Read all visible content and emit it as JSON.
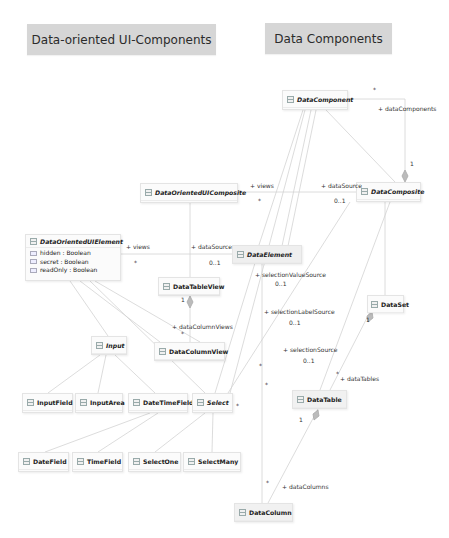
{
  "headers": {
    "ui_components": "Data-oriented UI-Components",
    "data_components": "Data Components"
  },
  "classes": {
    "DataComponent": {
      "name": "DataComponent",
      "abstract": true
    },
    "DataOrientedUIComposite": {
      "name": "DataOrientedUIComposite",
      "abstract": true
    },
    "DataComposite": {
      "name": "DataComposite",
      "abstract": true
    },
    "DataOrientedUIElement": {
      "name": "DataOrientedUIElement",
      "abstract": true,
      "attributes": [
        "hidden : Boolean",
        "secret : Boolean",
        "readOnly : Boolean"
      ]
    },
    "DataElement": {
      "name": "DataElement",
      "abstract": true
    },
    "DataTableView": {
      "name": "DataTableView",
      "abstract": false
    },
    "DataSet": {
      "name": "DataSet",
      "abstract": false
    },
    "Input": {
      "name": "Input",
      "abstract": true
    },
    "DataColumnView": {
      "name": "DataColumnView",
      "abstract": false
    },
    "InputField": {
      "name": "InputField",
      "abstract": false
    },
    "InputArea": {
      "name": "InputArea",
      "abstract": false
    },
    "DateTimeField": {
      "name": "DateTimeField",
      "abstract": false
    },
    "Select": {
      "name": "Select",
      "abstract": true
    },
    "DataTable": {
      "name": "DataTable",
      "abstract": false
    },
    "DateField": {
      "name": "DateField",
      "abstract": false
    },
    "TimeField": {
      "name": "TimeField",
      "abstract": false
    },
    "SelectOne": {
      "name": "SelectOne",
      "abstract": false
    },
    "SelectMany": {
      "name": "SelectMany",
      "abstract": false
    },
    "DataColumn": {
      "name": "DataColumn",
      "abstract": false
    }
  },
  "labels": {
    "dataComponents_mult": "*",
    "dataComponents_role": "+ dataComponents",
    "dataComponents_one": "1",
    "composite_views_role": "+ views",
    "composite_views_mult": "*",
    "composite_dataSource_role": "+ dataSource",
    "composite_dataSource_mult": "0..1",
    "element_views_role": "+ views",
    "element_views_mult": "*",
    "element_dataSource_role": "+ dataSource",
    "element_dataSource_mult": "0..1",
    "selectionValueSource_role": "+ selectionValueSource",
    "selectionValueSource_mult": "0..1",
    "selectionLabelSource_role": "+ selectionLabelSource",
    "selectionLabelSource_mult": "0..1",
    "selectionSource_role": "+ selectionSource",
    "selectionSource_mult": "0..1",
    "tableview_one": "1",
    "dataColumnViews_role": "+ dataColumnViews",
    "dataColumnViews_mult": "*",
    "dataset_one": "1",
    "dataTables_role": "+ dataTables",
    "dataTables_mult": "*",
    "datatable_one": "1",
    "dataColumns_role": "+ dataColumns",
    "dataColumns_mult": "*",
    "select_star1": "*",
    "select_star2": "*",
    "select_star3": "*"
  },
  "colors": {
    "header_bg": "#d6d6d6",
    "box_bg": "#fbfbfb",
    "edge": "#d0d0d0"
  }
}
